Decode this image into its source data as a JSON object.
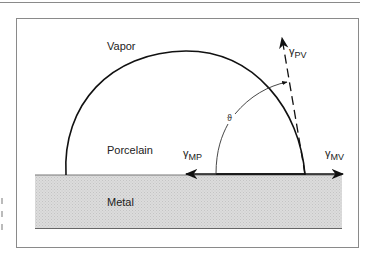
{
  "labels": {
    "vapor": "Vapor",
    "porcelain": "Porcelain",
    "metal": "Metal",
    "theta": "ϑ"
  },
  "vectors": {
    "pv": {
      "symbol": "γ",
      "subscript": "PV"
    },
    "mp": {
      "symbol": "γ",
      "subscript": "MP"
    },
    "mv": {
      "symbol": "γ",
      "subscript": "MV"
    }
  },
  "colors": {
    "line": "#111111",
    "metal_fill": "#d9d9d9",
    "frame": "#8a8a8a"
  }
}
